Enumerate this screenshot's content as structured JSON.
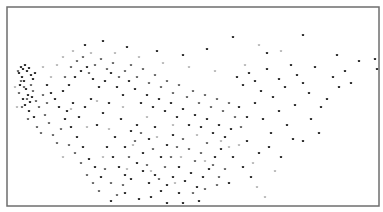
{
  "chart_data": {
    "type": "scatter",
    "title": "",
    "xlabel": "",
    "ylabel": "",
    "grid": false,
    "legend": null,
    "axes_visible": false,
    "frame": {
      "x": 7,
      "y": 7,
      "width": 372,
      "height": 199,
      "stroke": "#6e6e6e"
    },
    "xlim": [
      0,
      372
    ],
    "ylim": [
      0,
      199
    ],
    "marker_size": 2.2,
    "color_scale": {
      "dark": "#2a2a2a",
      "mid": "#6a6a6a",
      "light": "#c4c4c4"
    },
    "series": [
      {
        "name": "dark",
        "color": "#2f2f2f",
        "points": [
          [
            14,
            60
          ],
          [
            16,
            62
          ],
          [
            12,
            66
          ],
          [
            18,
            58
          ],
          [
            20,
            64
          ],
          [
            15,
            70
          ],
          [
            22,
            61
          ],
          [
            17,
            74
          ],
          [
            24,
            68
          ],
          [
            13,
            78
          ],
          [
            19,
            82
          ],
          [
            21,
            88
          ],
          [
            16,
            92
          ],
          [
            23,
            95
          ],
          [
            26,
            72
          ],
          [
            28,
            66
          ],
          [
            25,
            90
          ],
          [
            18,
            98
          ],
          [
            22,
            104
          ],
          [
            27,
            110
          ],
          [
            60,
            104
          ],
          [
            66,
            96
          ],
          [
            72,
            110
          ],
          [
            78,
            100
          ],
          [
            84,
            92
          ],
          [
            90,
            118
          ],
          [
            96,
            106
          ],
          [
            102,
            96
          ],
          [
            108,
            130
          ],
          [
            114,
            112
          ],
          [
            118,
            140
          ],
          [
            124,
            124
          ],
          [
            130,
            118
          ],
          [
            136,
            146
          ],
          [
            142,
            132
          ],
          [
            148,
            120
          ],
          [
            154,
            150
          ],
          [
            160,
            138
          ],
          [
            166,
            128
          ],
          [
            172,
            160
          ],
          [
            100,
            140
          ],
          [
            106,
            150
          ],
          [
            112,
            160
          ],
          [
            118,
            168
          ],
          [
            124,
            172
          ],
          [
            130,
            156
          ],
          [
            136,
            164
          ],
          [
            142,
            176
          ],
          [
            148,
            168
          ],
          [
            154,
            184
          ],
          [
            160,
            178
          ],
          [
            166,
            170
          ],
          [
            172,
            186
          ],
          [
            178,
            174
          ],
          [
            184,
            166
          ],
          [
            190,
            180
          ],
          [
            196,
            170
          ],
          [
            202,
            162
          ],
          [
            208,
            150
          ],
          [
            214,
            142
          ],
          [
            70,
            130
          ],
          [
            76,
            140
          ],
          [
            82,
            152
          ],
          [
            88,
            160
          ],
          [
            94,
            170
          ],
          [
            64,
            120
          ],
          [
            58,
            112
          ],
          [
            52,
            100
          ],
          [
            48,
            92
          ],
          [
            44,
            86
          ],
          [
            40,
            78
          ],
          [
            56,
            84
          ],
          [
            62,
            78
          ],
          [
            68,
            70
          ],
          [
            74,
            64
          ],
          [
            80,
            60
          ],
          [
            86,
            72
          ],
          [
            92,
            80
          ],
          [
            98,
            74
          ],
          [
            104,
            66
          ],
          [
            110,
            80
          ],
          [
            116,
            88
          ],
          [
            122,
            74
          ],
          [
            128,
            82
          ],
          [
            134,
            96
          ],
          [
            140,
            88
          ],
          [
            146,
            100
          ],
          [
            152,
            92
          ],
          [
            158,
            104
          ],
          [
            164,
            96
          ],
          [
            170,
            110
          ],
          [
            176,
            102
          ],
          [
            182,
            118
          ],
          [
            188,
            108
          ],
          [
            194,
            120
          ],
          [
            200,
            112
          ],
          [
            206,
            126
          ],
          [
            212,
            118
          ],
          [
            218,
            130
          ],
          [
            224,
            122
          ],
          [
            230,
            70
          ],
          [
            236,
            78
          ],
          [
            242,
            66
          ],
          [
            248,
            74
          ],
          [
            254,
            84
          ],
          [
            260,
            62
          ],
          [
            266,
            90
          ],
          [
            272,
            72
          ],
          [
            278,
            80
          ],
          [
            284,
            58
          ],
          [
            290,
            68
          ],
          [
            296,
            76
          ],
          [
            302,
            86
          ],
          [
            308,
            60
          ],
          [
            314,
            100
          ],
          [
            320,
            92
          ],
          [
            326,
            70
          ],
          [
            332,
            80
          ],
          [
            338,
            64
          ],
          [
            344,
            76
          ],
          [
            232,
            100
          ],
          [
            240,
            110
          ],
          [
            248,
            96
          ],
          [
            256,
            112
          ],
          [
            264,
            126
          ],
          [
            272,
            104
          ],
          [
            280,
            118
          ],
          [
            288,
            98
          ],
          [
            296,
            134
          ],
          [
            304,
            112
          ],
          [
            312,
            126
          ],
          [
            240,
            134
          ],
          [
            252,
            146
          ],
          [
            262,
            140
          ],
          [
            274,
            150
          ],
          [
            286,
            132
          ],
          [
            226,
            150
          ],
          [
            236,
            160
          ],
          [
            244,
            170
          ],
          [
            222,
            176
          ],
          [
            78,
            38
          ],
          [
            96,
            34
          ],
          [
            120,
            40
          ],
          [
            150,
            44
          ],
          [
            176,
            48
          ],
          [
            200,
            42
          ],
          [
            226,
            30
          ],
          [
            260,
            46
          ],
          [
            296,
            28
          ],
          [
            330,
            48
          ],
          [
            352,
            54
          ],
          [
            368,
            52
          ],
          [
            370,
            62
          ],
          [
            104,
            194
          ],
          [
            192,
            194
          ],
          [
            160,
            196
          ],
          [
            144,
            190
          ],
          [
            176,
            196
          ],
          [
            118,
            186
          ],
          [
            132,
            192
          ]
        ]
      },
      {
        "name": "mid",
        "color": "#6c6c6c",
        "points": [
          [
            11,
            64
          ],
          [
            14,
            74
          ],
          [
            17,
            80
          ],
          [
            12,
            86
          ],
          [
            20,
            92
          ],
          [
            15,
            100
          ],
          [
            24,
            78
          ],
          [
            26,
            84
          ],
          [
            29,
            94
          ],
          [
            21,
            112
          ],
          [
            30,
            120
          ],
          [
            34,
            126
          ],
          [
            38,
            108
          ],
          [
            42,
            116
          ],
          [
            46,
            128
          ],
          [
            50,
            136
          ],
          [
            54,
            122
          ],
          [
            40,
            96
          ],
          [
            36,
            88
          ],
          [
            32,
            100
          ],
          [
            62,
            138
          ],
          [
            68,
            146
          ],
          [
            74,
            156
          ],
          [
            80,
            168
          ],
          [
            86,
            176
          ],
          [
            92,
            184
          ],
          [
            98,
            162
          ],
          [
            104,
            176
          ],
          [
            110,
            188
          ],
          [
            116,
            178
          ],
          [
            122,
            150
          ],
          [
            128,
            134
          ],
          [
            134,
            126
          ],
          [
            140,
            158
          ],
          [
            146,
            142
          ],
          [
            152,
            172
          ],
          [
            158,
            160
          ],
          [
            164,
            150
          ],
          [
            170,
            140
          ],
          [
            176,
            132
          ],
          [
            58,
            70
          ],
          [
            64,
            60
          ],
          [
            70,
            54
          ],
          [
            76,
            50
          ],
          [
            82,
            66
          ],
          [
            88,
            58
          ],
          [
            94,
            52
          ],
          [
            100,
            62
          ],
          [
            106,
            56
          ],
          [
            112,
            70
          ],
          [
            118,
            64
          ],
          [
            124,
            58
          ],
          [
            130,
            70
          ],
          [
            136,
            62
          ],
          [
            142,
            76
          ],
          [
            148,
            68
          ],
          [
            154,
            80
          ],
          [
            160,
            74
          ],
          [
            166,
            86
          ],
          [
            172,
            78
          ],
          [
            180,
            90
          ],
          [
            186,
            84
          ],
          [
            192,
            96
          ],
          [
            198,
            88
          ],
          [
            204,
            100
          ],
          [
            210,
            92
          ],
          [
            216,
            104
          ],
          [
            222,
            96
          ],
          [
            228,
            110
          ],
          [
            234,
            120
          ],
          [
            182,
            142
          ],
          [
            188,
            154
          ],
          [
            194,
            146
          ],
          [
            200,
            136
          ],
          [
            206,
            158
          ],
          [
            212,
            170
          ],
          [
            218,
            162
          ],
          [
            186,
            186
          ],
          [
            198,
            182
          ],
          [
            210,
            178
          ]
        ]
      },
      {
        "name": "light",
        "color": "#bdbdbd",
        "points": [
          [
            8,
            80
          ],
          [
            10,
            100
          ],
          [
            36,
            60
          ],
          [
            44,
            70
          ],
          [
            50,
            58
          ],
          [
            56,
            50
          ],
          [
            66,
            44
          ],
          [
            84,
            46
          ],
          [
            108,
            46
          ],
          [
            132,
            50
          ],
          [
            156,
            56
          ],
          [
            182,
            60
          ],
          [
            208,
            64
          ],
          [
            238,
            58
          ],
          [
            252,
            38
          ],
          [
            274,
            44
          ],
          [
            64,
            102
          ],
          [
            90,
            94
          ],
          [
            116,
            100
          ],
          [
            140,
            110
          ],
          [
            166,
            118
          ],
          [
            190,
            128
          ],
          [
            214,
            134
          ],
          [
            232,
            138
          ],
          [
            80,
            120
          ],
          [
            102,
            122
          ],
          [
            126,
            138
          ],
          [
            150,
            130
          ],
          [
            174,
            150
          ],
          [
            198,
            154
          ],
          [
            222,
            140
          ],
          [
            246,
            156
          ],
          [
            268,
            164
          ],
          [
            250,
            180
          ],
          [
            258,
            190
          ],
          [
            96,
            150
          ],
          [
            120,
            162
          ],
          [
            144,
            164
          ],
          [
            168,
            176
          ],
          [
            56,
            150
          ]
        ]
      }
    ]
  }
}
